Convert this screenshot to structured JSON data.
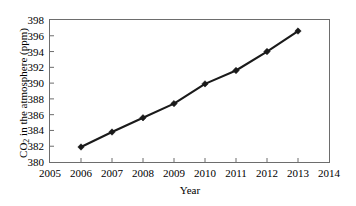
{
  "chart_data": {
    "type": "line",
    "title": "",
    "xlabel": "Year",
    "ylabel": "CO2 in the atmosphere (ppm)",
    "ylabel_parts": {
      "prefix": "CO",
      "sub": "2",
      "suffix": " in the atmosphere (ppm)"
    },
    "x": [
      2006,
      2007,
      2008,
      2009,
      2010,
      2011,
      2012,
      2013
    ],
    "values": [
      381.9,
      383.8,
      385.6,
      387.4,
      389.9,
      391.6,
      394.0,
      396.6
    ],
    "series": [
      {
        "name": "CO2 concentration",
        "x": [
          2006,
          2007,
          2008,
          2009,
          2010,
          2011,
          2012,
          2013
        ],
        "values": [
          381.9,
          383.8,
          385.6,
          387.4,
          389.9,
          391.6,
          394.0,
          396.6
        ]
      }
    ],
    "xlim": [
      2005,
      2014
    ],
    "ylim": [
      380,
      398
    ],
    "xticks": [
      2005,
      2006,
      2007,
      2008,
      2009,
      2010,
      2011,
      2012,
      2013,
      2014
    ],
    "yticks": [
      380,
      382,
      384,
      386,
      388,
      390,
      392,
      394,
      396,
      398
    ],
    "xtick_labels": [
      "2005",
      "2006",
      "2007",
      "2008",
      "2009",
      "2010",
      "2011",
      "2012",
      "2013",
      "2014"
    ],
    "ytick_labels": [
      "380",
      "382",
      "384",
      "386",
      "388",
      "390",
      "392",
      "394",
      "396",
      "398"
    ],
    "grid": false,
    "legend": null,
    "marker": "diamond",
    "line_color": "#1a1a1a",
    "marker_color": "#1a1a1a",
    "axis_color": "#6d6d6d",
    "background": "#ffffff"
  }
}
